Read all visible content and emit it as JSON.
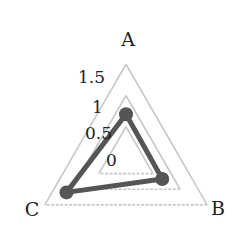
{
  "chart_data": {
    "type": "radar",
    "title": "",
    "axes": [
      "A",
      "B",
      "C"
    ],
    "series": [
      {
        "name": "",
        "values": [
          0.7,
          0.67,
          1.1
        ],
        "color": "#555555"
      }
    ],
    "radial_ticks": [
      0,
      0.5,
      1,
      1.5
    ],
    "radial_tick_labels": [
      "0",
      "0.5",
      "1",
      "1.5"
    ],
    "rlim": [
      0,
      1.5
    ],
    "grid": true,
    "grid_color": "#c8c8c8",
    "legend": "none"
  }
}
